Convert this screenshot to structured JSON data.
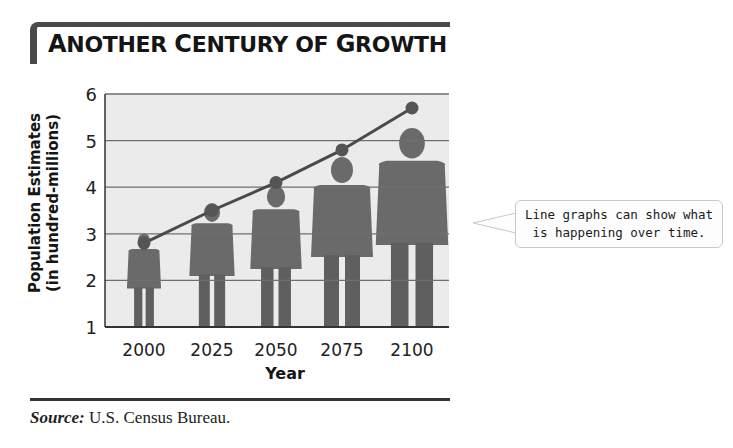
{
  "title": {
    "first": "A",
    "rest1": "NOTHER ",
    "c": "C",
    "rest2": "ENTURY OF ",
    "g": "G",
    "rest3": "ROWTH",
    "full": "Another Century of Growth"
  },
  "ylabel_line1": "Population Estimates",
  "ylabel_line2": "(in hundred-millions)",
  "xlabel": "Year",
  "source_label": "Source:",
  "source_text": " U.S. Census Bureau.",
  "callout_line1": "Line graphs can show what",
  "callout_line2": "is happening over time.",
  "colors": {
    "plot_bg": "#ebebeb",
    "grid": "#6f6f6f",
    "line": "#4a4a4a",
    "marker": "#555555",
    "figure": "#6a6a6a"
  },
  "chart_data": {
    "type": "line",
    "title": "Another Century of Growth",
    "xlabel": "Year",
    "ylabel": "Population Estimates (in hundred-millions)",
    "categories": [
      "2000",
      "2025",
      "2050",
      "2075",
      "2100"
    ],
    "values": [
      2.8,
      3.5,
      4.1,
      4.8,
      5.7
    ],
    "yticks": [
      1,
      2,
      3,
      4,
      5,
      6
    ],
    "ylim": [
      1,
      6
    ],
    "grid": true,
    "legend": null,
    "decoration": "Human silhouettes of increasing size behind each data point",
    "source": "Source: U.S. Census Bureau."
  }
}
